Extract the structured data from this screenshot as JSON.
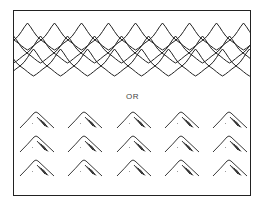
{
  "diagram": {
    "separator_label": "OR",
    "top_pattern": "overlapping-scalloped-arches",
    "bottom_pattern": "grid-of-hatched-mountain-glyphs",
    "mountain_grid": {
      "rows": 3,
      "columns": 5
    },
    "colors": {
      "stroke": "#222222",
      "background": "#ffffff",
      "text": "#444444"
    }
  }
}
